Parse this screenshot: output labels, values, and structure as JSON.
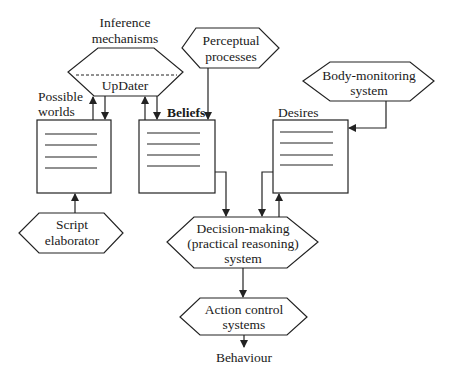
{
  "diagram": {
    "nodes": {
      "inference": {
        "title_line1": "Inference",
        "title_line2": "mechanisms",
        "inner_label": "UpDater",
        "shape": "hexagon"
      },
      "perceptual": {
        "line1": "Perceptual",
        "line2": "processes",
        "shape": "hexagon"
      },
      "body_monitoring": {
        "line1": "Body-monitoring",
        "line2": "system",
        "shape": "hexagon"
      },
      "possible_worlds": {
        "line1": "Possible",
        "line2": "worlds",
        "shape": "store"
      },
      "beliefs": {
        "label": "Beliefs",
        "shape": "store"
      },
      "desires": {
        "label": "Desires",
        "shape": "store"
      },
      "script_elaborator": {
        "line1": "Script",
        "line2": "elaborator",
        "shape": "hexagon"
      },
      "decision_making": {
        "line1": "Decision-making",
        "line2": "(practical reasoning)",
        "line3": "system",
        "shape": "hexagon"
      },
      "action_control": {
        "line1": "Action control",
        "line2": "systems",
        "shape": "hexagon"
      },
      "behaviour": {
        "label": "Behaviour",
        "shape": "text"
      }
    },
    "edges": [
      {
        "from": "possible_worlds",
        "to": "inference"
      },
      {
        "from": "inference",
        "to": "possible_worlds"
      },
      {
        "from": "beliefs",
        "to": "inference"
      },
      {
        "from": "inference",
        "to": "beliefs"
      },
      {
        "from": "perceptual",
        "to": "beliefs"
      },
      {
        "from": "body_monitoring",
        "to": "desires"
      },
      {
        "from": "script_elaborator",
        "to": "possible_worlds"
      },
      {
        "from": "beliefs",
        "to": "decision_making"
      },
      {
        "from": "desires",
        "to": "decision_making"
      },
      {
        "from": "decision_making",
        "to": "desires"
      },
      {
        "from": "decision_making",
        "to": "action_control"
      },
      {
        "from": "action_control",
        "to": "behaviour"
      }
    ]
  }
}
